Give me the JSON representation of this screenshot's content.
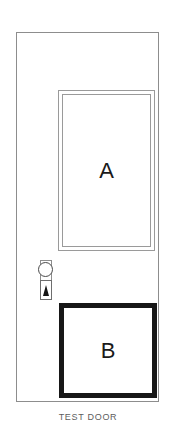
{
  "figure": {
    "caption": "TEST DOOR",
    "background_color": "#ffffff"
  },
  "door": {
    "outline_color": "#8d8d8d",
    "fill_color": "#ffffff",
    "panels": [
      {
        "id": "A",
        "label": "A",
        "kind": "glazed-upper-panel",
        "frame_style": "double-thin-line",
        "frame_color": "#9a9a9a",
        "fill_color": "#ffffff",
        "label_color": "#1a1a1a"
      },
      {
        "id": "B",
        "label": "B",
        "kind": "solid-lower-panel",
        "frame_style": "thick-solid-line",
        "frame_color": "#171717",
        "fill_color": "#ffffff",
        "label_color": "#1a1a1a"
      }
    ],
    "hardware": {
      "name": "door-lock-assembly",
      "knob_shape": "circle",
      "knob_color": "#4a4a4a",
      "backplate_color": "#8d8d8d",
      "cylinder_plate_color": "#6e6e6e",
      "keyhole_shape": "triangle",
      "keyhole_color": "#141414"
    }
  }
}
